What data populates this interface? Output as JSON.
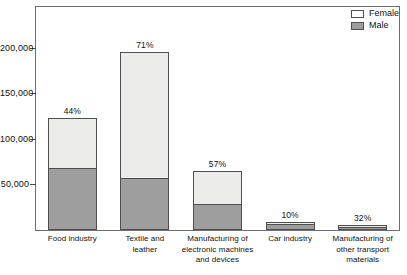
{
  "top_caption": "",
  "legend": {
    "position": "top-right",
    "entries": [
      {
        "label": "Female",
        "color": "#ffffff"
      },
      {
        "label": "Male",
        "color": "#9e9e9e"
      }
    ]
  },
  "axis": {
    "y_ticks": [
      "200,000",
      "150,000",
      "100,000",
      "50,000"
    ]
  },
  "chart_data": {
    "type": "bar",
    "subtype": "stacked-vertical",
    "title": "",
    "xlabel": "",
    "ylabel": "",
    "ylim": [
      0,
      245000
    ],
    "yticks": [
      50000,
      100000,
      150000,
      200000
    ],
    "ytick_labels": [
      "50,000",
      "100,000",
      "150,000",
      "200,000"
    ],
    "grid": false,
    "legend_position": "top-right",
    "categories": [
      "Food industry",
      "Textile and leather",
      "Manufacturing of electronic machines and devices",
      "Car industry",
      "Manufacturing of other transport materials"
    ],
    "category_label_lines": [
      [
        "Food industry"
      ],
      [
        "Textile and",
        "leather"
      ],
      [
        "Manufacturing of",
        "electronic machines",
        "and devices"
      ],
      [
        "Car industry"
      ],
      [
        "Manufacturing of",
        "other transport",
        "materials"
      ]
    ],
    "series": [
      {
        "name": "Male",
        "color": "#9e9e9e",
        "values": [
          68500,
          57000,
          28500,
          8000,
          3800
        ]
      },
      {
        "name": "Female",
        "color": "#ececea",
        "values": [
          54500,
          139000,
          36500,
          1000,
          1700
        ]
      }
    ],
    "totals": [
      123000,
      196000,
      65000,
      9000,
      5500
    ],
    "annotations": {
      "name": "female share",
      "labels": [
        "44%",
        "71%",
        "57%",
        "10%",
        "32%"
      ],
      "values": [
        44,
        71,
        57,
        10,
        32
      ]
    }
  }
}
